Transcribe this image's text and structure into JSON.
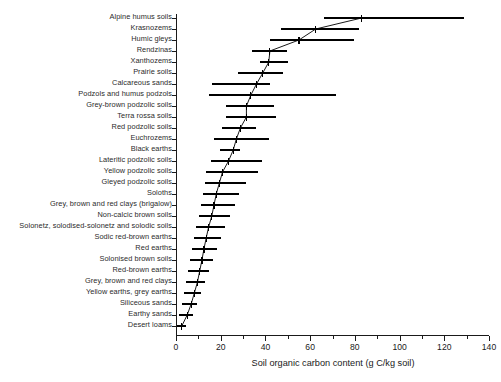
{
  "chart_data": {
    "type": "bar",
    "orientation": "horizontal",
    "title": "",
    "xlabel": "Soil organic carbon content (g C/kg soil)",
    "ylabel": "",
    "xlim": [
      0,
      140
    ],
    "xticks": [
      0,
      20,
      40,
      60,
      80,
      100,
      120,
      140
    ],
    "xticklabels": [
      "0",
      "20",
      "40",
      "60",
      "80",
      "100",
      "120",
      "140"
    ],
    "minor_xticks": [
      10,
      30,
      50,
      70,
      90,
      110,
      130
    ],
    "grid": false,
    "legend": null,
    "marker_note": "vertical tick = mean, horizontal bar = range, thin line connects means",
    "categories": [
      "Alpine humus soils",
      "Krasnozems",
      "Humic gleys",
      "Rendzinas",
      "Xanthozems",
      "Prairie soils",
      "Calcareous sands",
      "Podzols and humus podzols",
      "Grey-brown podzolic soils",
      "Terra rossa soils",
      "Red podzolic soils",
      "Euchrozems",
      "Black earths",
      "Lateritic podzolic soils",
      "Yellow podzolic soils",
      "Gleyed podzolic soils",
      "Soloths",
      "Grey, brown and red clays (brigalow)",
      "Non-calcic brown soils",
      "Solonetz, solodised-solonetz and solodic soils",
      "Sodic red-brown earths",
      "Red earths",
      "Solonised brown soils",
      "Red-brown earths",
      "Grey, brown and red clays",
      "Yellow earths, grey earths",
      "Siliceous sands",
      "Earthy sands",
      "Desert loams"
    ],
    "means": [
      83.0,
      62.5,
      55.0,
      42.0,
      41.5,
      38.8,
      36.0,
      33.5,
      31.5,
      31.5,
      28.8,
      27.0,
      25.6,
      23.5,
      20.8,
      19.4,
      18.0,
      17.0,
      16.0,
      14.6,
      13.5,
      12.5,
      11.6,
      10.6,
      9.6,
      8.2,
      6.8,
      5.0,
      2.6
    ],
    "range_low": [
      66.0,
      47.0,
      42.0,
      33.8,
      37.4,
      27.9,
      16.2,
      14.9,
      22.5,
      22.5,
      20.7,
      17.1,
      19.8,
      15.8,
      13.5,
      13.1,
      12.2,
      11.0,
      10.5,
      9.0,
      8.1,
      7.2,
      6.3,
      5.4,
      4.5,
      3.6,
      2.7,
      1.4,
      0.4
    ],
    "range_high": [
      129.0,
      82.0,
      79.7,
      49.5,
      50.0,
      47.7,
      41.9,
      71.6,
      43.7,
      44.6,
      36.0,
      41.4,
      28.8,
      38.3,
      36.9,
      31.5,
      28.4,
      26.6,
      24.3,
      22.1,
      20.3,
      18.5,
      16.7,
      14.9,
      13.1,
      11.3,
      9.5,
      7.7,
      4.5
    ]
  },
  "axis": {
    "x_title": "Soil organic carbon content (g C/kg soil)"
  }
}
